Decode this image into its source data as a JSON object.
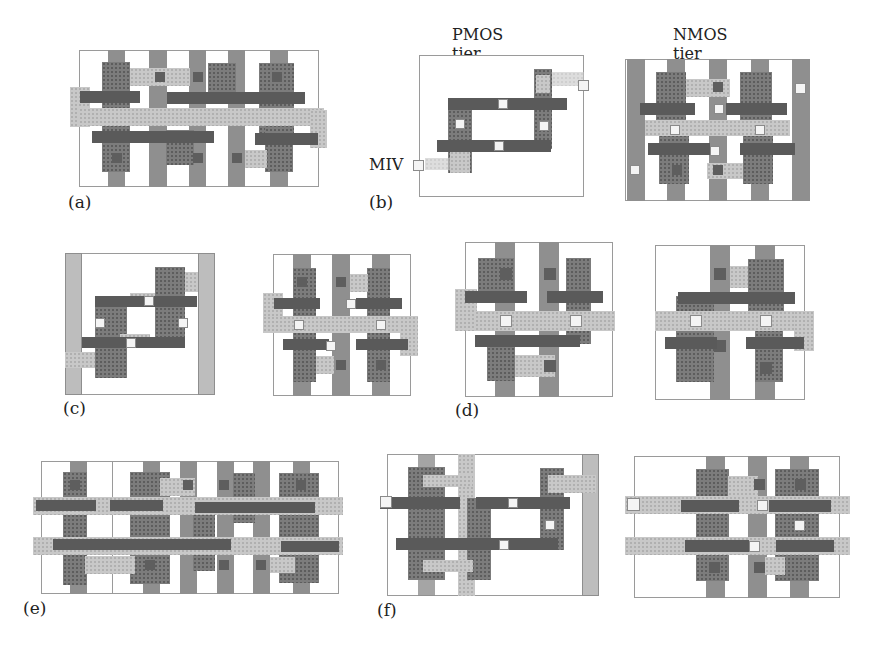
{
  "figure": {
    "panels": [
      {
        "id": "a",
        "label": "(a)",
        "description": "2D standard cell layout"
      },
      {
        "id": "b",
        "label": "(b)",
        "description": "Transistor-level monolithic 3D cell",
        "tiers": [
          "PMOS tier",
          "NMOS tier"
        ],
        "annotation": "MIV"
      },
      {
        "id": "c",
        "label": "(c)"
      },
      {
        "id": "d",
        "label": "(d)"
      },
      {
        "id": "e",
        "label": "(e)"
      },
      {
        "id": "f",
        "label": "(f)"
      }
    ],
    "labels": {
      "a": "(a)",
      "b": "(b)",
      "c": "(c)",
      "d": "(d)",
      "e": "(e)",
      "f": "(f)",
      "pmos_tier": "PMOS tier",
      "nmos_tier": "NMOS tier",
      "miv": "MIV"
    },
    "colors": {
      "background": "#ffffff",
      "frame": "#9a9a9a",
      "poly": "#8f8f8f",
      "diffusion": "#7c7c7c",
      "metal1": "#c8c8c8",
      "gate_bar": "#5a5a5a",
      "contact": "#5e5e5e",
      "miv": "#f4f4f4"
    }
  }
}
